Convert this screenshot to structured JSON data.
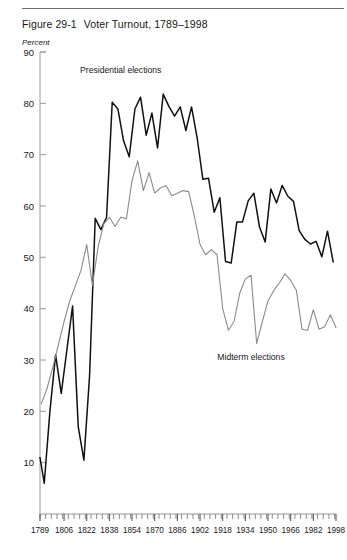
{
  "figure": {
    "number": "Figure 29-1",
    "title": "Voter Turnout, 1789–1998",
    "unit_label": "Percent"
  },
  "chart_data": {
    "type": "line",
    "title": "Voter Turnout, 1789–1998",
    "xlabel": "",
    "ylabel": "Percent",
    "xlim": [
      1789,
      1998
    ],
    "ylim": [
      0,
      90
    ],
    "yticks": [
      10,
      20,
      30,
      40,
      50,
      60,
      70,
      80,
      90
    ],
    "xticks": [
      1789,
      1806,
      1822,
      1838,
      1854,
      1870,
      1886,
      1902,
      1918,
      1934,
      1950,
      1966,
      1982,
      1998
    ],
    "minor_tick_interval": 4,
    "grid": false,
    "legend": "annotations",
    "annotations": [
      {
        "text": "Presidential elections",
        "x": 1846,
        "y": 86,
        "series": "presidential"
      },
      {
        "text": "Midterm elections",
        "x": 1938,
        "y": 30,
        "series": "midterm"
      }
    ],
    "series": [
      {
        "name": "Presidential elections",
        "color": "#101010",
        "x": [
          1789,
          1792,
          1796,
          1800,
          1804,
          1808,
          1812,
          1816,
          1820,
          1824,
          1828,
          1832,
          1836,
          1840,
          1844,
          1848,
          1852,
          1856,
          1860,
          1864,
          1868,
          1872,
          1876,
          1880,
          1884,
          1888,
          1892,
          1896,
          1900,
          1904,
          1908,
          1912,
          1916,
          1920,
          1924,
          1928,
          1932,
          1936,
          1940,
          1944,
          1948,
          1952,
          1956,
          1960,
          1964,
          1968,
          1972,
          1976,
          1980,
          1984,
          1988,
          1992,
          1996
        ],
        "values": [
          11.0,
          6.0,
          20.0,
          31.0,
          23.5,
          32.0,
          40.5,
          17.0,
          10.5,
          26.9,
          57.6,
          55.4,
          57.8,
          80.2,
          78.9,
          72.7,
          69.6,
          78.9,
          81.2,
          73.8,
          78.1,
          71.3,
          81.8,
          79.4,
          77.5,
          79.3,
          74.7,
          79.3,
          73.2,
          65.2,
          65.4,
          58.8,
          61.6,
          49.2,
          48.9,
          56.9,
          56.9,
          61.0,
          62.5,
          55.9,
          53.0,
          63.3,
          60.6,
          64.0,
          61.9,
          60.9,
          55.2,
          53.5,
          52.6,
          53.1,
          50.1,
          55.1,
          49.1
        ]
      },
      {
        "name": "Midterm elections",
        "color": "#8a8a8a",
        "x": [
          1790,
          1794,
          1798,
          1802,
          1806,
          1810,
          1814,
          1818,
          1822,
          1826,
          1830,
          1834,
          1838,
          1842,
          1846,
          1850,
          1854,
          1858,
          1862,
          1866,
          1870,
          1874,
          1878,
          1882,
          1886,
          1890,
          1894,
          1898,
          1902,
          1906,
          1910,
          1914,
          1918,
          1922,
          1926,
          1930,
          1934,
          1938,
          1942,
          1946,
          1950,
          1954,
          1958,
          1962,
          1966,
          1970,
          1974,
          1978,
          1982,
          1986,
          1990,
          1994,
          1998
        ],
        "values": [
          21.5,
          24.5,
          28.5,
          33.0,
          37.5,
          41.5,
          44.5,
          47.5,
          52.5,
          44.5,
          52.0,
          56.5,
          57.8,
          56.0,
          57.8,
          57.5,
          65.0,
          68.8,
          63.0,
          66.5,
          62.5,
          63.5,
          64.0,
          62.0,
          62.5,
          63.0,
          62.8,
          58.0,
          52.5,
          50.5,
          51.5,
          50.5,
          40.0,
          35.8,
          37.5,
          43.0,
          45.8,
          46.5,
          33.2,
          37.5,
          41.5,
          43.5,
          45.0,
          46.8,
          45.5,
          43.6,
          36.0,
          35.8,
          39.8,
          36.0,
          36.5,
          38.8,
          36.3
        ]
      }
    ]
  }
}
